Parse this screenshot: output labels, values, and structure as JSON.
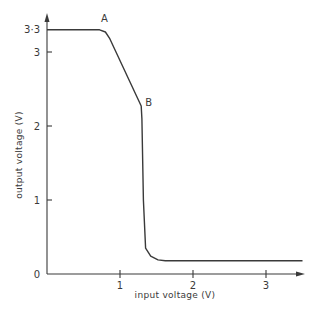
{
  "chart_data": {
    "type": "line",
    "title": "",
    "xlabel": "input voltage (V)",
    "ylabel": "output voltage (V)",
    "xlim": [
      0,
      3.5
    ],
    "ylim": [
      0,
      3.4
    ],
    "grid": false,
    "x_ticks": [
      {
        "value": 1,
        "label": "1"
      },
      {
        "value": 2,
        "label": "2"
      },
      {
        "value": 3,
        "label": "3"
      }
    ],
    "y_ticks": [
      {
        "value": 0,
        "label": "0"
      },
      {
        "value": 1,
        "label": "1"
      },
      {
        "value": 2,
        "label": "2"
      },
      {
        "value": 3,
        "label": "3"
      },
      {
        "value": 3.3,
        "label": "3·3"
      }
    ],
    "series": [
      {
        "name": "transfer characteristic",
        "x": [
          0,
          0.72,
          0.8,
          0.86,
          1.29,
          1.3,
          1.32,
          1.35,
          1.42,
          1.52,
          1.62,
          3.5
        ],
        "y": [
          3.3,
          3.3,
          3.27,
          3.18,
          2.27,
          2.1,
          1.0,
          0.35,
          0.24,
          0.19,
          0.18,
          0.18
        ]
      }
    ],
    "annotations": [
      {
        "label": "A",
        "x": 0.78,
        "y": 3.3
      },
      {
        "label": "B",
        "x": 1.29,
        "y": 2.27
      }
    ]
  }
}
